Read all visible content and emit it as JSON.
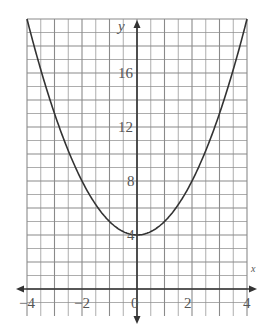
{
  "chart_data": {
    "type": "line",
    "title": "",
    "xlabel": "x",
    "ylabel": "y",
    "function": "y = x^2 + 4",
    "xlim": [
      -4,
      4
    ],
    "ylim": [
      -1,
      20
    ],
    "grid": true,
    "grid_step_x": 0.5,
    "grid_step_y": 1,
    "x_ticks": [
      "-4",
      "-2",
      "0",
      "2",
      "4"
    ],
    "y_ticks": [
      "4",
      "8",
      "12",
      "16"
    ],
    "series": [
      {
        "name": "parabola",
        "x": [
          -4,
          -3,
          -2,
          -1,
          0,
          1,
          2,
          3,
          4
        ],
        "values": [
          20,
          13,
          8,
          5,
          4,
          5,
          8,
          13,
          20
        ]
      }
    ],
    "vertex": [
      0,
      4
    ]
  },
  "axes": {
    "x_label": "x",
    "y_label": "y",
    "colors": {
      "grid": "#8a8a8a",
      "axis": "#333333",
      "curve": "#333333",
      "text": "#555555"
    }
  }
}
